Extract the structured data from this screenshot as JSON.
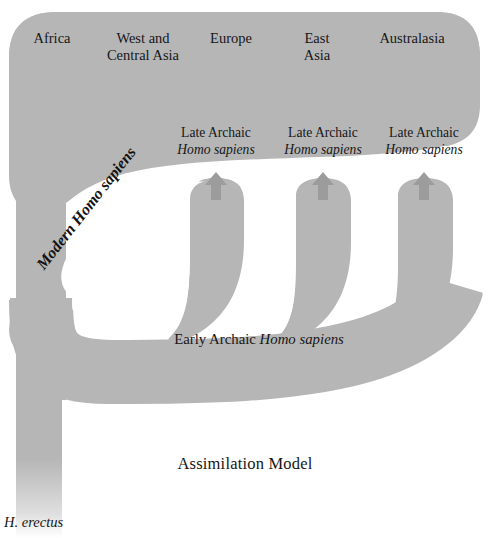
{
  "figure": {
    "title": "Assimilation Model",
    "background_color": "#ffffff",
    "shape_color": "#b6b6b6",
    "text_color": "#161616"
  },
  "regions": [
    {
      "name": "region-africa",
      "line1": "Africa",
      "line2": "",
      "x": 52,
      "y": 30
    },
    {
      "name": "region-west-central-asia",
      "line1": "West and",
      "line2": "Central Asia",
      "x": 143,
      "y": 30
    },
    {
      "name": "region-europe",
      "line1": "Europe",
      "line2": "",
      "x": 231,
      "y": 30
    },
    {
      "name": "region-east-asia",
      "line1": "East",
      "line2": "Asia",
      "x": 317,
      "y": 30
    },
    {
      "name": "region-australasia",
      "line1": "Australasia",
      "line2": "",
      "x": 412,
      "y": 30
    }
  ],
  "late_archaic_nodes": [
    {
      "name": "late-archaic-europe",
      "line1": "Late Archaic",
      "species": "Homo sapiens",
      "x": 216,
      "y": 125
    },
    {
      "name": "late-archaic-east-asia",
      "line1": "Late Archaic",
      "species": "Homo sapiens",
      "x": 323,
      "y": 125
    },
    {
      "name": "late-archaic-australasia",
      "line1": "Late Archaic",
      "species": "Homo sapiens",
      "x": 424,
      "y": 125
    }
  ],
  "arrows": [
    {
      "name": "arrow-to-europe",
      "x": 216,
      "y_top": 174,
      "y_bottom": 196
    },
    {
      "name": "arrow-to-east-asia",
      "x": 323,
      "y_top": 174,
      "y_bottom": 196
    },
    {
      "name": "arrow-to-australasia",
      "x": 424,
      "y_top": 174,
      "y_bottom": 196
    }
  ],
  "flow_labels": {
    "modern": {
      "prefix": "Modern ",
      "species": "Homo sapiens",
      "full": "Modern Homo sapiens",
      "rotation_deg": -52,
      "x": 33,
      "y": 256
    },
    "early_archaic": {
      "prefix": "Early Archaic ",
      "species": "Homo sapiens",
      "full": "Early Archaic Homo sapiens",
      "x": 259,
      "y": 331
    },
    "erectus": {
      "text": "H. erectus",
      "x": 4,
      "y": 516
    }
  },
  "model_title": {
    "text": "Assimilation Model",
    "x": 245,
    "y": 463
  }
}
